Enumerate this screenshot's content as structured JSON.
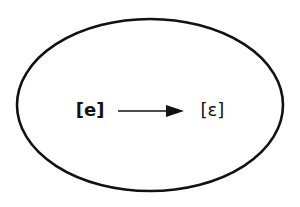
{
  "diagram": {
    "shape": {
      "kind": "ellipse",
      "stroke_color": "#111111",
      "stroke_width": 2.6,
      "fill_color": "#ffffff"
    },
    "background_color": "#ffffff",
    "rule": {
      "source_label": "[e]",
      "arrow_label": "becomes",
      "target_label": "[ɛ]",
      "arrow_icon": "right-arrow-icon",
      "arrow_color": "#111111"
    }
  }
}
